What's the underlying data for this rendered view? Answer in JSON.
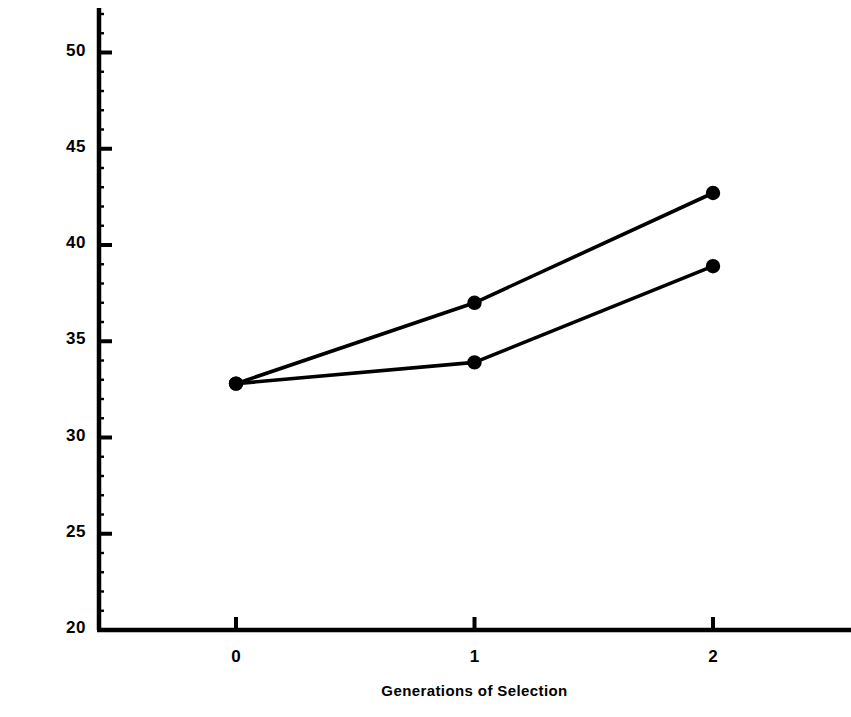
{
  "chart_data": {
    "type": "line",
    "title": "",
    "xlabel": "Generations of Selection",
    "ylabel": "Days to 50% Mortality",
    "x": [
      0,
      1,
      2
    ],
    "xlim": [
      -0.99,
      2.58
    ],
    "ylim": [
      20,
      52.3
    ],
    "xticks": [
      "0",
      "1",
      "2"
    ],
    "yticks": [
      "20",
      "25",
      "30",
      "35",
      "40",
      "45",
      "50"
    ],
    "ytick_values": [
      20,
      25,
      30,
      35,
      40,
      45,
      50
    ],
    "grid": false,
    "legend": "none",
    "marker": "filled-circle",
    "line_color": "#000000",
    "series": [
      {
        "name": "upper",
        "values": [
          32.8,
          37.0,
          42.7
        ]
      },
      {
        "name": "lower",
        "values": [
          32.8,
          33.9,
          38.9
        ]
      }
    ]
  }
}
